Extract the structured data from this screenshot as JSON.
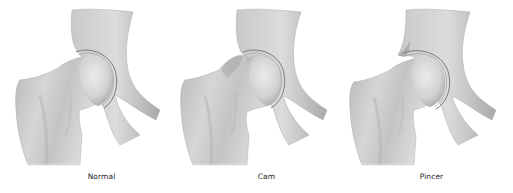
{
  "figure": {
    "panels": [
      {
        "id": "normal",
        "caption": "Normal",
        "variant": "normal-hip"
      },
      {
        "id": "cam",
        "caption": "Cam",
        "variant": "cam-impingement-hip"
      },
      {
        "id": "pincer",
        "caption": "Pincer",
        "variant": "pincer-impingement-hip"
      }
    ],
    "colors": {
      "background": "#ffffff",
      "bone_light": "#e6e6e6",
      "bone_mid": "#bdbdbd",
      "bone_dark": "#8e8e8e",
      "cartilage_line": "#7a7a7a",
      "caption_text": "#222222"
    }
  }
}
